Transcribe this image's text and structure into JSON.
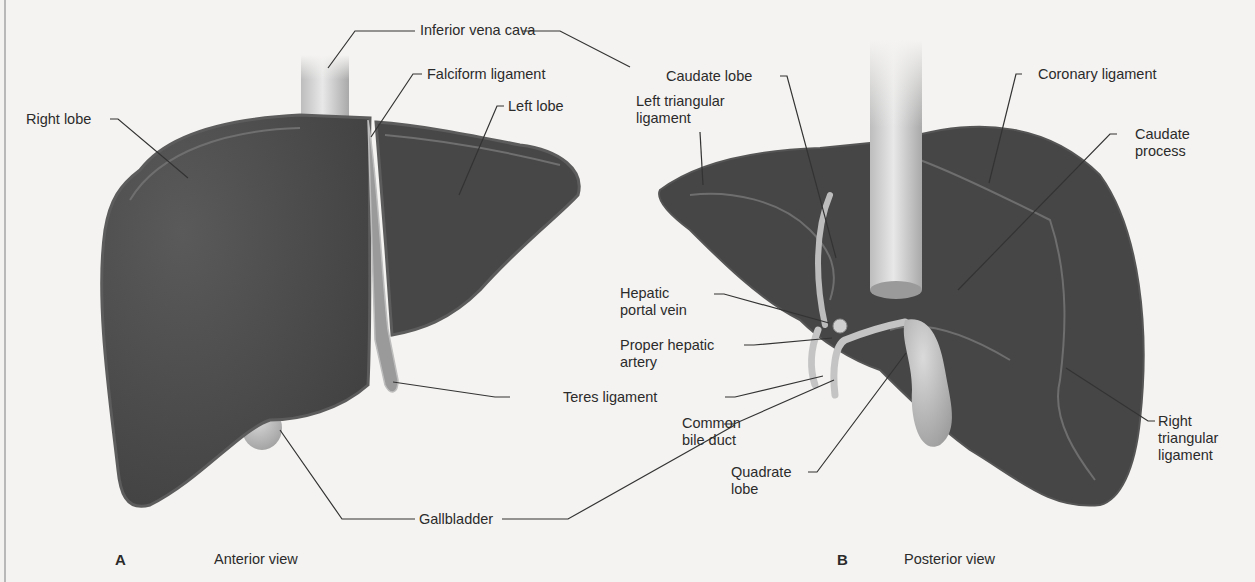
{
  "figure": {
    "panel_a": {
      "letter": "A",
      "title": "Anterior view",
      "labels": {
        "right_lobe": "Right lobe",
        "falciform_ligament": "Falciform ligament",
        "left_lobe": "Left lobe",
        "teres_ligament": "Teres ligament",
        "gallbladder": "Gallbladder"
      }
    },
    "panel_b": {
      "letter": "B",
      "title": "Posterior view",
      "labels": {
        "caudate_lobe": "Caudate lobe",
        "left_triangular_ligament": "Left triangular\nligament",
        "coronary_ligament": "Coronary ligament",
        "caudate_process": "Caudate\nprocess",
        "hepatic_portal_vein": "Hepatic\nportal vein",
        "proper_hepatic_artery": "Proper hepatic\nartery",
        "common_bile_duct": "Common\nbile duct",
        "quadrate_lobe": "Quadrate\nlobe",
        "right_triangular_ligament": "Right\ntriangular\nligament"
      }
    },
    "shared_labels": {
      "inferior_vena_cava": "Inferior vena cava",
      "gallbladder": "Gallbladder",
      "teres_ligament": "Teres ligament"
    },
    "colors": {
      "liver": "#4a4a4a",
      "liver_rim": "#6a6a6a",
      "vessel": "#cfcfcf",
      "gallbladder": "#bdbdbd",
      "background": "#f4f3f1",
      "leader_line": "#333333"
    }
  }
}
